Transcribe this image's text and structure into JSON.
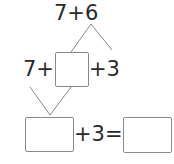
{
  "problem": {
    "top_expression": "7+6",
    "middle": {
      "prefix": "7+",
      "suffix": "+3",
      "blank_value": ""
    },
    "bottom": {
      "suffix": "+3=",
      "blank_left_value": "",
      "blank_right_value": ""
    }
  },
  "colors": {
    "line": "#888888",
    "text": "#2a2a2a",
    "box_border": "#8a8a8a"
  }
}
